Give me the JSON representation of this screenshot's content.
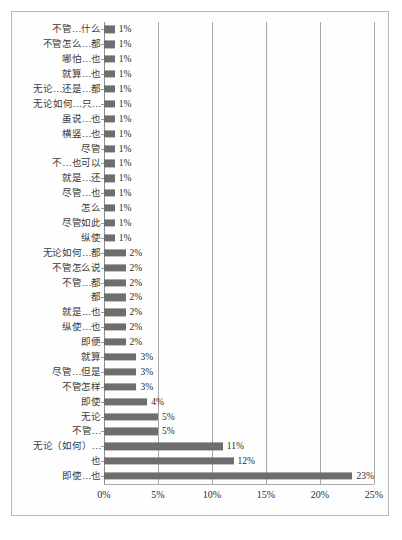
{
  "chart_data": {
    "type": "bar",
    "orientation": "horizontal",
    "title": "",
    "subtitle": "",
    "xlabel": "",
    "ylabel": "",
    "xlim": [
      0,
      25
    ],
    "xticks": [
      0,
      5,
      10,
      15,
      20,
      25
    ],
    "xtick_labels": [
      "0%",
      "5%",
      "10%",
      "15%",
      "20%",
      "25%"
    ],
    "grid": "vertical",
    "legend": "none",
    "value_suffix": "%",
    "bar_color": "#6e6e6e",
    "gridline_color": "#a8a8a8",
    "categories": [
      "不管…什么",
      "不管怎么…都",
      "哪怕…也",
      "就算…也",
      "无论…还是…都",
      "无论如何…只…",
      "虽说…也",
      "横竖…也",
      "尽管",
      "不…也可以",
      "就是…还",
      "尽管…也",
      "怎么",
      "尽管如此",
      "纵使",
      "无论如何…都",
      "不管怎么说",
      "不管…都",
      "都",
      "就是…也",
      "纵使…也",
      "即便",
      "就算",
      "尽管…但是",
      "不管怎样",
      "即使",
      "无论",
      "不管…",
      "无论（如何）…",
      "也",
      "即使…也"
    ],
    "values": [
      1,
      1,
      1,
      1,
      1,
      1,
      1,
      1,
      1,
      1,
      1,
      1,
      1,
      1,
      1,
      2,
      2,
      2,
      2,
      2,
      2,
      2,
      3,
      3,
      3,
      4,
      5,
      5,
      11,
      12,
      23
    ],
    "value_labels": [
      "1%",
      "1%",
      "1%",
      "1%",
      "1%",
      "1%",
      "1%",
      "1%",
      "1%",
      "1%",
      "1%",
      "1%",
      "1%",
      "1%",
      "1%",
      "2%",
      "2%",
      "2%",
      "2%",
      "2%",
      "2%",
      "2%",
      "3%",
      "3%",
      "3%",
      "4%",
      "5%",
      "5%",
      "11%",
      "12%",
      "23%"
    ]
  }
}
